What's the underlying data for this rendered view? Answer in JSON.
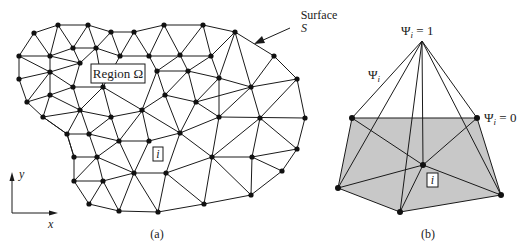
{
  "panel_a": {
    "caption": "(a)",
    "region_label": "Region Ω",
    "surface_label_line1": "Surface",
    "surface_label_line2": "S",
    "node_label": "i",
    "axis_x_label": "x",
    "axis_y_label": "y"
  },
  "panel_b": {
    "caption": "(b)",
    "apex_label_sym": "Ψ",
    "apex_label_sub": "i",
    "apex_label_val": " = 1",
    "edge_label_sym": "Ψ",
    "edge_label_sub": "i",
    "corner_label_sym": "Ψ",
    "corner_label_sub": "i",
    "corner_label_val": " = 0",
    "node_label": "i"
  },
  "colors": {
    "line": "#1a1a1a",
    "node": "#111111",
    "shaded_element": "#c8c8c8",
    "background": "#ffffff"
  }
}
